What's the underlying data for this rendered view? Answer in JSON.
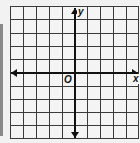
{
  "diagram": {
    "type": "coordinate-plane",
    "grid": {
      "columns": 10,
      "rows": 10,
      "cell_size_px": 13
    },
    "axes": {
      "x_label": "x",
      "y_label": "y",
      "origin_label": "O",
      "arrows": [
        "left",
        "right",
        "up",
        "down"
      ]
    },
    "colors": {
      "grid_line": "#3a3a3a",
      "axis": "#111111",
      "background": "#f4f4f4"
    }
  }
}
